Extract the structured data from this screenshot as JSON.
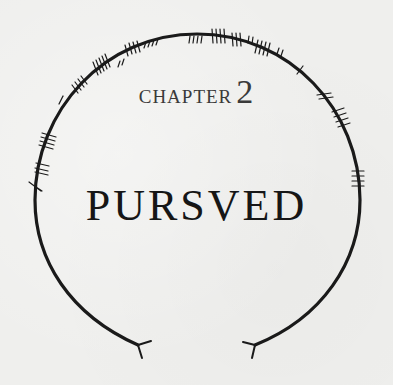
{
  "chapter": {
    "label": "CHAPTER",
    "number": "2",
    "title": "PURSVED"
  },
  "decoration": {
    "type": "ogham-ring-icon",
    "stroke_color": "#1a1a1a",
    "background_color": "#efefed"
  }
}
